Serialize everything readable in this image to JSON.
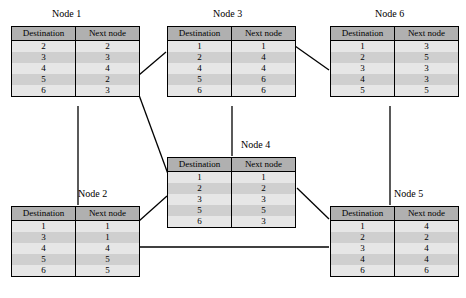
{
  "diagram": {
    "columns": [
      "Destination",
      "Next node"
    ],
    "nodes": [
      {
        "id": "node1",
        "label": "Node 1",
        "title_x": 52,
        "title_y": 8,
        "table_x": 11,
        "table_y": 26,
        "rows": [
          {
            "destination": "2",
            "next_node": "2"
          },
          {
            "destination": "3",
            "next_node": "3"
          },
          {
            "destination": "4",
            "next_node": "4"
          },
          {
            "destination": "5",
            "next_node": "2"
          },
          {
            "destination": "6",
            "next_node": "3"
          }
        ]
      },
      {
        "id": "node3",
        "label": "Node 3",
        "title_x": 213,
        "title_y": 8,
        "table_x": 167,
        "table_y": 26,
        "rows": [
          {
            "destination": "1",
            "next_node": "1"
          },
          {
            "destination": "2",
            "next_node": "4"
          },
          {
            "destination": "4",
            "next_node": "4"
          },
          {
            "destination": "5",
            "next_node": "6"
          },
          {
            "destination": "6",
            "next_node": "6"
          }
        ]
      },
      {
        "id": "node6",
        "label": "Node 6",
        "title_x": 375,
        "title_y": 8,
        "table_x": 330,
        "table_y": 26,
        "rows": [
          {
            "destination": "1",
            "next_node": "3"
          },
          {
            "destination": "2",
            "next_node": "5"
          },
          {
            "destination": "3",
            "next_node": "3"
          },
          {
            "destination": "4",
            "next_node": "3"
          },
          {
            "destination": "5",
            "next_node": "5"
          }
        ]
      },
      {
        "id": "node4",
        "label": "Node 4",
        "title_x": 241,
        "title_y": 139,
        "table_x": 167,
        "table_y": 157,
        "rows": [
          {
            "destination": "1",
            "next_node": "1"
          },
          {
            "destination": "2",
            "next_node": "2"
          },
          {
            "destination": "3",
            "next_node": "3"
          },
          {
            "destination": "5",
            "next_node": "5"
          },
          {
            "destination": "6",
            "next_node": "3"
          }
        ]
      },
      {
        "id": "node2",
        "label": "Node 2",
        "title_x": 78,
        "title_y": 188,
        "table_x": 11,
        "table_y": 206,
        "rows": [
          {
            "destination": "1",
            "next_node": "1"
          },
          {
            "destination": "3",
            "next_node": "1"
          },
          {
            "destination": "4",
            "next_node": "4"
          },
          {
            "destination": "5",
            "next_node": "5"
          },
          {
            "destination": "6",
            "next_node": "5"
          }
        ]
      },
      {
        "id": "node5",
        "label": "Node 5",
        "title_x": 394,
        "title_y": 188,
        "table_x": 330,
        "table_y": 206,
        "rows": [
          {
            "destination": "1",
            "next_node": "4"
          },
          {
            "destination": "2",
            "next_node": "2"
          },
          {
            "destination": "3",
            "next_node": "4"
          },
          {
            "destination": "4",
            "next_node": "4"
          },
          {
            "destination": "6",
            "next_node": "6"
          }
        ]
      }
    ],
    "links": [
      {
        "name": "link-node1-node3",
        "from": "node1",
        "to": "node3",
        "x1": 139,
        "y1": 75,
        "x2": 166,
        "y2": 52
      },
      {
        "name": "link-node3-node6",
        "from": "node3",
        "to": "node6",
        "x1": 295,
        "y1": 46,
        "x2": 329,
        "y2": 70
      },
      {
        "name": "link-node1-node2",
        "from": "node1",
        "to": "node2",
        "x1": 78,
        "y1": 106,
        "x2": 78,
        "y2": 205
      },
      {
        "name": "link-node3-node4",
        "from": "node3",
        "to": "node4",
        "x1": 232,
        "y1": 106,
        "x2": 232,
        "y2": 156
      },
      {
        "name": "link-node6-node5",
        "from": "node6",
        "to": "node5",
        "x1": 390,
        "y1": 106,
        "x2": 390,
        "y2": 205
      },
      {
        "name": "link-node1-node4",
        "from": "node1",
        "to": "node4",
        "x1": 139,
        "y1": 95,
        "x2": 168,
        "y2": 174
      },
      {
        "name": "link-node2-node4",
        "from": "node2",
        "to": "node4",
        "x1": 139,
        "y1": 221,
        "x2": 167,
        "y2": 196
      },
      {
        "name": "link-node4-node5",
        "from": "node4",
        "to": "node5",
        "x1": 297,
        "y1": 188,
        "x2": 329,
        "y2": 219
      },
      {
        "name": "link-node2-node5-horizontal",
        "from": "node2",
        "to": "node5",
        "x1": 139,
        "y1": 247,
        "x2": 329,
        "y2": 247
      }
    ],
    "colors": {
      "header_fill": "#b0b0b0",
      "row_light": "#e6e6e6",
      "row_dark": "#cfcfcf",
      "border": "#000000",
      "link": "#000000",
      "background": "#ffffff"
    }
  }
}
